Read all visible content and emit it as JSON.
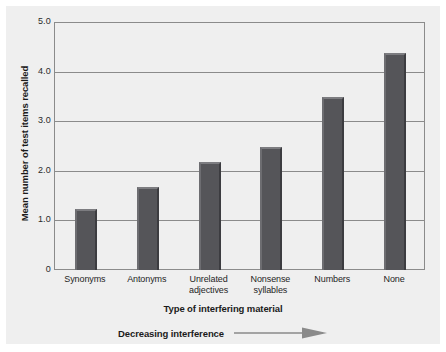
{
  "chart_data": {
    "type": "bar",
    "title": "",
    "xlabel": "Type of interfering material",
    "ylabel": "Mean number of test items recalled",
    "categories": [
      "Synonyms",
      "Unrelated\nadjectives",
      "Antonyms",
      "Nonsense\nsyllables",
      "Numbers",
      "None"
    ],
    "bars": [
      {
        "label_line1": "Synonyms",
        "label_line2": "",
        "value": 1.25
      },
      {
        "label_line1": "Antonyms",
        "label_line2": "",
        "value": 1.7
      },
      {
        "label_line1": "Unrelated",
        "label_line2": "adjectives",
        "value": 2.2
      },
      {
        "label_line1": "Nonsense",
        "label_line2": "syllables",
        "value": 2.5
      },
      {
        "label_line1": "Numbers",
        "label_line2": "",
        "value": 3.5
      },
      {
        "label_line1": "None",
        "label_line2": "",
        "value": 4.4
      }
    ],
    "yticks": [
      "5.0",
      "4.0",
      "3.0",
      "2.0",
      "1.0",
      "0"
    ],
    "ytick_values": [
      5.0,
      4.0,
      3.0,
      2.0,
      1.0,
      0
    ],
    "ylim": [
      0,
      5.0
    ],
    "grid": true,
    "legend": "none",
    "annotation": {
      "text": "Decreasing interference",
      "arrow": "right-arrow-icon"
    },
    "colors": {
      "bar_fill": "#555559",
      "bar_highlight": "#7c7c80",
      "bar_shadow": "#3c3c40",
      "panel_background": "#efefef",
      "grid": "#8b8b8b",
      "text": "#1b1b1b",
      "arrow": "#8a8a8a"
    }
  }
}
